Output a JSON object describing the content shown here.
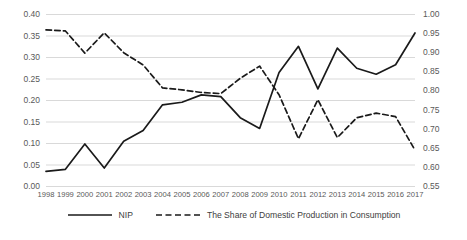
{
  "chart_data": {
    "type": "line",
    "title": "",
    "xlabel": "",
    "ylabel": "",
    "grid": true,
    "legend_position": "bottom",
    "categories": [
      "1998",
      "1999",
      "2000",
      "2001",
      "2002",
      "2003",
      "2004",
      "2005",
      "2006",
      "2007",
      "2008",
      "2009",
      "2010",
      "2011",
      "2012",
      "2013",
      "2014",
      "2015",
      "2016",
      "2017"
    ],
    "x": [
      1998,
      1999,
      2000,
      2001,
      2002,
      2003,
      2004,
      2005,
      2006,
      2007,
      2008,
      2009,
      2010,
      2011,
      2012,
      2013,
      2014,
      2015,
      2016,
      2017
    ],
    "axes": {
      "left": {
        "label": "",
        "ylim": [
          0.0,
          0.4
        ],
        "tick_step": 0.05,
        "ticks": [
          "0.00",
          "0.05",
          "0.10",
          "0.15",
          "0.20",
          "0.25",
          "0.30",
          "0.35",
          "0.40"
        ],
        "tick_values": [
          0.0,
          0.05,
          0.1,
          0.15,
          0.2,
          0.25,
          0.3,
          0.35,
          0.4
        ]
      },
      "right": {
        "label": "",
        "ylim": [
          0.55,
          1.0
        ],
        "tick_step": 0.05,
        "ticks": [
          "0.55",
          "0.60",
          "0.65",
          "0.70",
          "0.75",
          "0.80",
          "0.85",
          "0.90",
          "0.95",
          "1.00"
        ],
        "tick_values": [
          0.55,
          0.6,
          0.65,
          0.7,
          0.75,
          0.8,
          0.85,
          0.9,
          0.95,
          1.0
        ]
      }
    },
    "series": [
      {
        "name": "NIP",
        "axis": "left",
        "style": "solid",
        "color": "#1a1a1a",
        "values": [
          0.035,
          0.04,
          0.099,
          0.043,
          0.105,
          0.13,
          0.19,
          0.196,
          0.213,
          0.209,
          0.16,
          0.135,
          0.265,
          0.326,
          0.227,
          0.322,
          0.275,
          0.261,
          0.283,
          0.357
        ]
      },
      {
        "name": "The Share of Domestic Production in Consumption",
        "axis": "right",
        "style": "dashed",
        "color": "#1a1a1a",
        "values": [
          0.96,
          0.957,
          0.899,
          0.952,
          0.9,
          0.868,
          0.808,
          0.803,
          0.796,
          0.793,
          0.833,
          0.865,
          0.79,
          0.675,
          0.777,
          0.678,
          0.73,
          0.742,
          0.733,
          0.645
        ]
      }
    ]
  },
  "legend": {
    "items": [
      {
        "label": "NIP",
        "style": "solid"
      },
      {
        "label": "The Share of Domestic Production in Consumption",
        "style": "dashed"
      }
    ]
  },
  "colors": {
    "series_line": "#1a1a1a",
    "grid": "#d9d9d9",
    "tick_text": "#595959",
    "background": "#ffffff"
  }
}
